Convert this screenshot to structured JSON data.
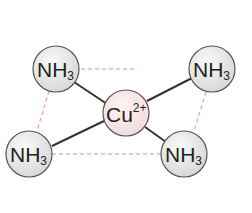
{
  "diagram": {
    "center": {
      "label": "Cu",
      "charge": "2+",
      "x": 126,
      "y": 113,
      "r": 23,
      "fill": "#f8e6e6"
    },
    "ligands": [
      {
        "id": "top-left",
        "label": "NH",
        "subscript": "3",
        "x": 56,
        "y": 69,
        "r": 23
      },
      {
        "id": "top-right",
        "label": "NH",
        "subscript": "3",
        "x": 212,
        "y": 69,
        "r": 23
      },
      {
        "id": "bottom-left",
        "label": "NH",
        "subscript": "3",
        "x": 29,
        "y": 154,
        "r": 23
      },
      {
        "id": "bottom-right",
        "label": "NH",
        "subscript": "3",
        "x": 184,
        "y": 154,
        "r": 23
      }
    ],
    "colors": {
      "bond": "#333333",
      "dashed": "#e58a8a",
      "ligand_fill": "#e6e6e6",
      "outline": "#555555"
    }
  }
}
